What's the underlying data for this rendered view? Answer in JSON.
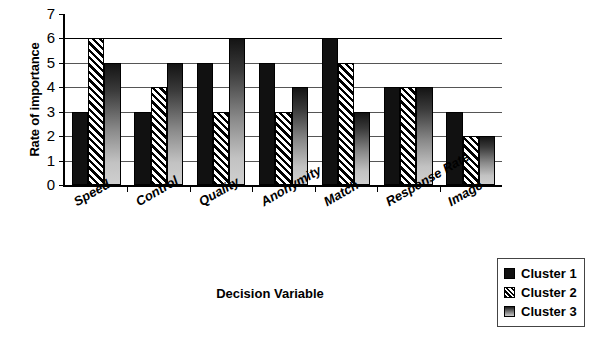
{
  "chart_data": {
    "type": "bar",
    "title": "",
    "xlabel": "Decision Variable",
    "ylabel": "Rate of importance",
    "categories": [
      "Speed",
      "Control",
      "Quality",
      "Anonymity",
      "Match",
      "Response Rate",
      "Image"
    ],
    "series": [
      {
        "name": "Cluster 1",
        "values": [
          3,
          3,
          5,
          5,
          6,
          4,
          3
        ]
      },
      {
        "name": "Cluster 2",
        "values": [
          6,
          4,
          3,
          3,
          5,
          4,
          2
        ]
      },
      {
        "name": "Cluster 3",
        "values": [
          5,
          5,
          6,
          4,
          3,
          4,
          2
        ]
      }
    ],
    "ylim": [
      0,
      7
    ],
    "y_ticks": [
      0,
      1,
      2,
      3,
      4,
      5,
      6,
      7
    ],
    "grid": true,
    "legend_position": "bottom-right"
  },
  "legend": {
    "entries": [
      {
        "label": "Cluster 1",
        "pattern": "solid-black",
        "color": "#111111"
      },
      {
        "label": "Cluster 2",
        "pattern": "diagonal-hatch",
        "color": "#000000"
      },
      {
        "label": "Cluster 3",
        "pattern": "gradient-gray",
        "color": "#8a8a8a"
      }
    ]
  }
}
